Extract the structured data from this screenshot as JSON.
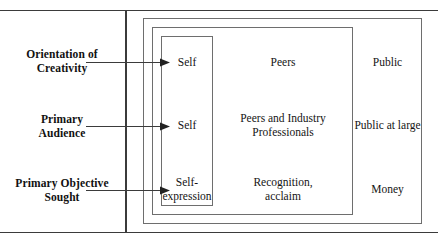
{
  "figure": {
    "colors": {
      "frame_rule": "#3b3b3b",
      "nested_box_border": "#6e6e6e",
      "text": "#141414",
      "background": "#ffffff"
    }
  },
  "rows": [
    {
      "label": "Orientation of\nCreativity",
      "label_line1": "Orientation of",
      "label_line2": "Creativity",
      "arrow": "right-arrow-icon",
      "inner": "Self",
      "middle": "Peers",
      "outer": "Public"
    },
    {
      "label": "Primary\nAudience",
      "label_line1": "Primary",
      "label_line2": "Audience",
      "arrow": "right-arrow-icon",
      "inner": "Self",
      "middle_line1": "Peers and Industry",
      "middle_line2": "Professionals",
      "outer": "Public at large"
    },
    {
      "label": "Primary Objective\nSought",
      "label_line1": "Primary Objective",
      "label_line2": "Sought",
      "arrow": "right-arrow-icon",
      "inner_line1": "Self-",
      "inner_line2": "expression",
      "middle_line1": "Recognition,",
      "middle_line2": "acclaim",
      "outer": "Money"
    }
  ],
  "boxes": {
    "inner_name": "innermost-scope-box",
    "middle_name": "middle-scope-box",
    "outer_name": "outermost-scope-box"
  }
}
